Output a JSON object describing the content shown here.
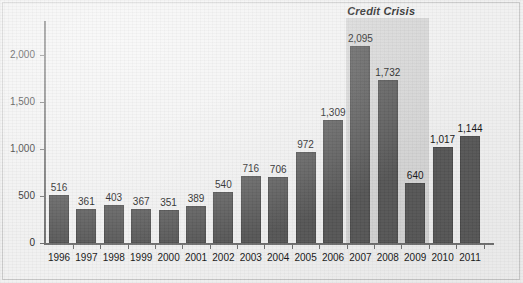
{
  "chart_data": {
    "type": "bar",
    "title": "",
    "xlabel": "",
    "ylabel": "",
    "categories": [
      "1996",
      "1997",
      "1998",
      "1999",
      "2000",
      "2001",
      "2002",
      "2003",
      "2004",
      "2005",
      "2006",
      "2007",
      "2008",
      "2009",
      "2010",
      "2011"
    ],
    "values": [
      516,
      361,
      403,
      367,
      351,
      389,
      540,
      716,
      706,
      972,
      1309,
      2095,
      1732,
      640,
      1017,
      1144
    ],
    "value_labels": [
      "516",
      "361",
      "403",
      "367",
      "351",
      "389",
      "540",
      "716",
      "706",
      "972",
      "1,309",
      "2,095",
      "1,732",
      "640",
      "1,017",
      "1,144"
    ],
    "ylim": [
      0,
      2300
    ],
    "yticks": [
      0,
      500,
      1000,
      1500,
      2000
    ],
    "ytick_labels": [
      "0",
      "500",
      "1,000",
      "1,500",
      "2,000"
    ],
    "grid": false,
    "legend": "none",
    "bar_color": "#565656",
    "background_color": "#f1f1f1",
    "annotations": [
      {
        "text": "Credit Crisis",
        "style": "bold-italic",
        "span_categories": [
          "2007",
          "2008",
          "2009"
        ],
        "band_color": "#d5d5d5"
      }
    ]
  }
}
